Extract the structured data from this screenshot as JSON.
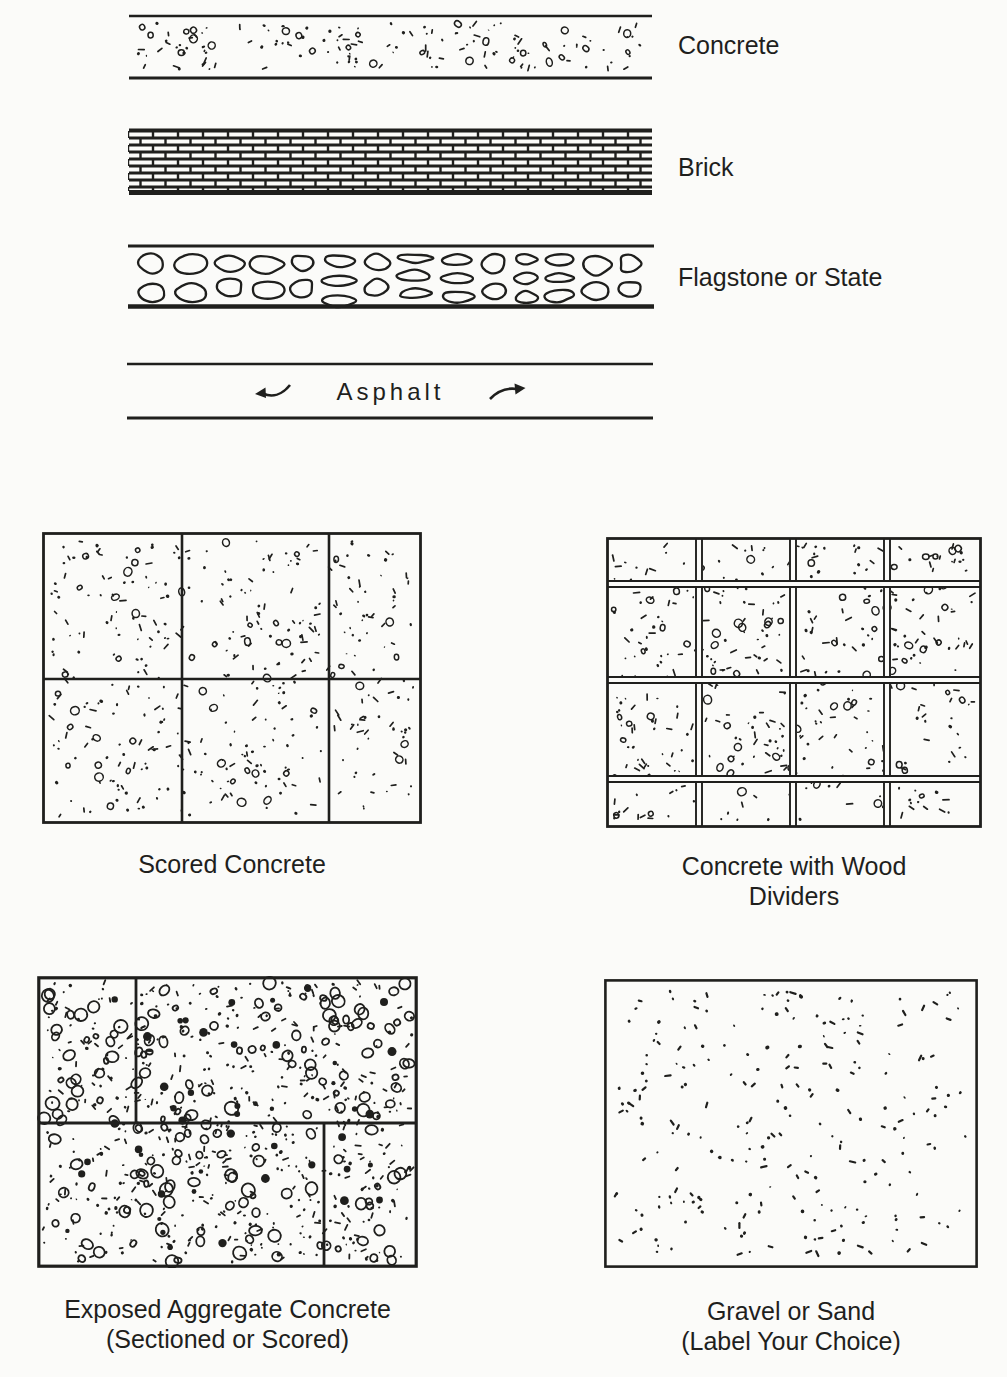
{
  "page": {
    "paper_color": "#fbfbf9",
    "ink_color": "#1f1f1d"
  },
  "strip_legend": {
    "items": [
      {
        "label": "Concrete",
        "texture": "concrete-stipple"
      },
      {
        "label": "Brick",
        "texture": "brick-courses"
      },
      {
        "label": "Flagstone or State",
        "texture": "flagstone-blobs"
      },
      {
        "label": "Asphalt",
        "texture": "plain-band"
      }
    ]
  },
  "icons": {
    "asphalt_left": "curved-left-arrow",
    "asphalt_right": "curved-right-arrow"
  },
  "panels": [
    {
      "caption_line1": "Scored Concrete"
    },
    {
      "caption_line1": "Concrete with Wood",
      "caption_line2": "Dividers"
    },
    {
      "caption_line1": "Exposed Aggregate Concrete",
      "caption_line2": "(Sectioned or Scored)"
    },
    {
      "caption_line1": "Gravel or Sand",
      "caption_line2": "(Label Your Choice)"
    }
  ]
}
